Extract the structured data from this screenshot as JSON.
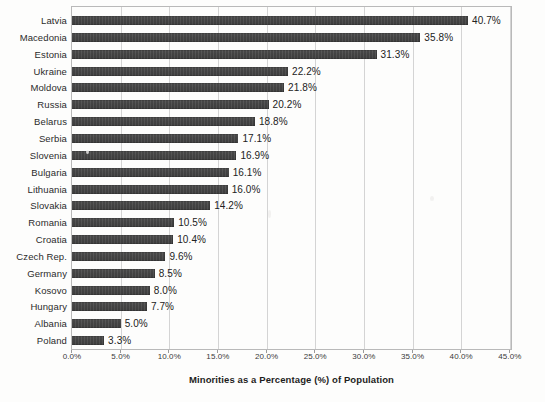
{
  "chart_data": {
    "type": "bar",
    "orientation": "horizontal",
    "title": "",
    "xlabel": "Minorities as a Percentage (%) of Population",
    "ylabel": "",
    "xlim": [
      0,
      45
    ],
    "xtick_labels": [
      "0.0%",
      "5.0%",
      "10.0%",
      "15.0%",
      "20.0%",
      "25.0%",
      "30.0%",
      "35.0%",
      "40.0%",
      "45.0%"
    ],
    "xtick_values": [
      0,
      5,
      10,
      15,
      20,
      25,
      30,
      35,
      40,
      45
    ],
    "grid": "vertical",
    "legend": "none",
    "bar_color": "#474747",
    "categories": [
      "Latvia",
      "Macedonia",
      "Estonia",
      "Ukraine",
      "Moldova",
      "Russia",
      "Belarus",
      "Serbia",
      "Slovenia",
      "Bulgaria",
      "Lithuania",
      "Slovakia",
      "Romania",
      "Croatia",
      "Czech Rep.",
      "Germany",
      "Kosovo",
      "Hungary",
      "Albania",
      "Poland"
    ],
    "values": [
      40.7,
      35.8,
      31.3,
      22.2,
      21.8,
      20.2,
      18.8,
      17.1,
      16.9,
      16.1,
      16.0,
      14.2,
      10.5,
      10.4,
      9.6,
      8.5,
      8.0,
      7.7,
      5.0,
      3.3
    ],
    "data_labels": [
      "40.7%",
      "35.8%",
      "31.3%",
      "22.2%",
      "21.8%",
      "20.2%",
      "18.8%",
      "17.1%",
      "16.9%",
      "16.1%",
      "16.0%",
      "14.2%",
      "10.5%",
      "10.4%",
      "9.6%",
      "8.5%",
      "8.0%",
      "7.7%",
      "5.0%",
      "3.3%"
    ]
  }
}
